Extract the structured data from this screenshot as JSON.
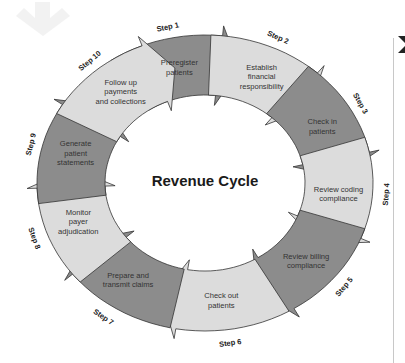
{
  "title": "Revenue Cycle",
  "colors": {
    "dark": "#8c8c8c",
    "light": "#dcdcdc",
    "stroke": "#333333"
  },
  "steps": [
    {
      "step": "Step 1",
      "lines": [
        "Preregister",
        "patients"
      ]
    },
    {
      "step": "Step 2",
      "lines": [
        "Establish",
        "financial",
        "responsibility"
      ]
    },
    {
      "step": "Step 3",
      "lines": [
        "Check in",
        "patients"
      ]
    },
    {
      "step": "Step 4",
      "lines": [
        "Review coding",
        "compliance"
      ]
    },
    {
      "step": "Step 5",
      "lines": [
        "Review billing",
        "compliance"
      ]
    },
    {
      "step": "Step 6",
      "lines": [
        "Check out",
        "patients"
      ]
    },
    {
      "step": "Step 7",
      "lines": [
        "Prepare and",
        "transmit claims"
      ]
    },
    {
      "step": "Step 8",
      "lines": [
        "Monitor",
        "payer",
        "adjudication"
      ]
    },
    {
      "step": "Step 9",
      "lines": [
        "Generate",
        "patient",
        "statements"
      ]
    },
    {
      "step": "Step 10",
      "lines": [
        "Follow up",
        "payments",
        "and collections"
      ]
    }
  ]
}
